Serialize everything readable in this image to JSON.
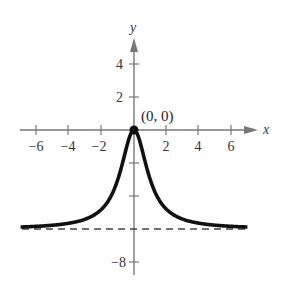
{
  "chart_data": {
    "type": "line",
    "title": "",
    "xlabel": "x",
    "ylabel": "y",
    "xlim": [
      -7,
      7
    ],
    "ylim": [
      -8,
      5
    ],
    "x_ticks": [
      -6,
      -4,
      -2,
      2,
      4,
      6
    ],
    "x_tick_labels": [
      "−6",
      "−4",
      "−2",
      "2",
      "4",
      "6"
    ],
    "y_ticks": [
      4,
      2,
      -2,
      -4,
      -6,
      -8
    ],
    "y_tick_labels": [
      "4",
      "2",
      "",
      "",
      "",
      "−8"
    ],
    "grid": false,
    "legend": null,
    "series": [
      {
        "name": "f(x)",
        "style": "solid-thick",
        "x": [
          -7,
          -6,
          -5,
          -4,
          -3,
          -2,
          -1.5,
          -1,
          -0.5,
          0,
          0.5,
          1,
          1.5,
          2,
          3,
          4,
          5,
          6,
          7
        ],
        "y": [
          -5.88,
          -5.84,
          -5.77,
          -5.65,
          -5.4,
          -4.8,
          -4.15,
          -3.0,
          -1.2,
          0,
          -1.2,
          -3.0,
          -4.15,
          -4.8,
          -5.4,
          -5.65,
          -5.77,
          -5.84,
          -5.88
        ]
      },
      {
        "name": "horizontal asymptote y = -6",
        "style": "dashed",
        "x": [
          -7,
          7
        ],
        "y": [
          -6,
          -6
        ]
      }
    ],
    "annotations": [
      {
        "text": "(0, 0)",
        "x": 0,
        "y": 0,
        "marker": "filled-dot"
      }
    ]
  },
  "labels": {
    "x_axis": "x",
    "y_axis": "y",
    "point": "(0, 0)",
    "x_ticks": [
      "−6",
      "−4",
      "−2",
      "2",
      "4",
      "6"
    ],
    "y_tick_4": "4",
    "y_tick_2": "2",
    "y_tick_neg8": "−8"
  }
}
